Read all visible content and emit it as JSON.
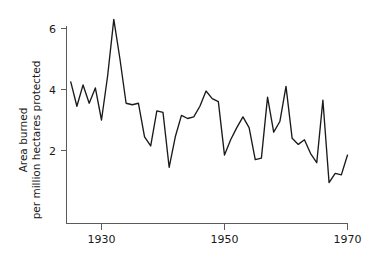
{
  "chart_data": {
    "type": "line",
    "title": "",
    "xlabel": "",
    "ylabel_line1": "Area burned",
    "ylabel_line2": "per million hectares protected",
    "xlim": [
      1925,
      1970
    ],
    "ylim": [
      0,
      6.6
    ],
    "grid": false,
    "legend": "none",
    "xticks": [
      1930,
      1950,
      1970
    ],
    "xtick_labels": [
      "1930",
      "1950",
      "1970"
    ],
    "yticks": [
      2,
      4,
      6
    ],
    "ytick_labels": [
      "2",
      "4",
      "6"
    ],
    "series_name": "Area burned per million hectares protected",
    "line_color": "#1a1a1a",
    "axis_color": "#5b5b5b",
    "x": [
      1925,
      1926,
      1927,
      1928,
      1929,
      1930,
      1931,
      1932,
      1933,
      1934,
      1935,
      1936,
      1937,
      1938,
      1939,
      1940,
      1941,
      1942,
      1943,
      1944,
      1945,
      1946,
      1947,
      1948,
      1949,
      1950,
      1951,
      1952,
      1953,
      1954,
      1955,
      1956,
      1957,
      1958,
      1959,
      1960,
      1961,
      1962,
      1963,
      1964,
      1965,
      1966,
      1967,
      1968,
      1969,
      1970
    ],
    "values": [
      4.25,
      3.45,
      4.15,
      3.55,
      4.05,
      3.0,
      4.45,
      6.3,
      5.0,
      3.55,
      3.5,
      3.55,
      2.45,
      2.15,
      3.3,
      3.25,
      1.45,
      2.45,
      3.15,
      3.05,
      3.1,
      3.45,
      3.95,
      3.7,
      3.6,
      1.85,
      2.35,
      2.75,
      3.1,
      2.75,
      1.7,
      1.75,
      3.75,
      2.6,
      2.95,
      4.1,
      2.4,
      2.2,
      2.35,
      1.9,
      1.6,
      3.65,
      0.95,
      1.25,
      1.2,
      1.85
    ],
    "x_extended": [
      1963.5,
      1964,
      1965,
      1966,
      1967,
      1968,
      1969,
      1970
    ],
    "note_max": 6.3,
    "note_min": 0.55
  },
  "axes": {
    "y_axis_name": "y-axis",
    "x_axis_name": "x-axis"
  }
}
